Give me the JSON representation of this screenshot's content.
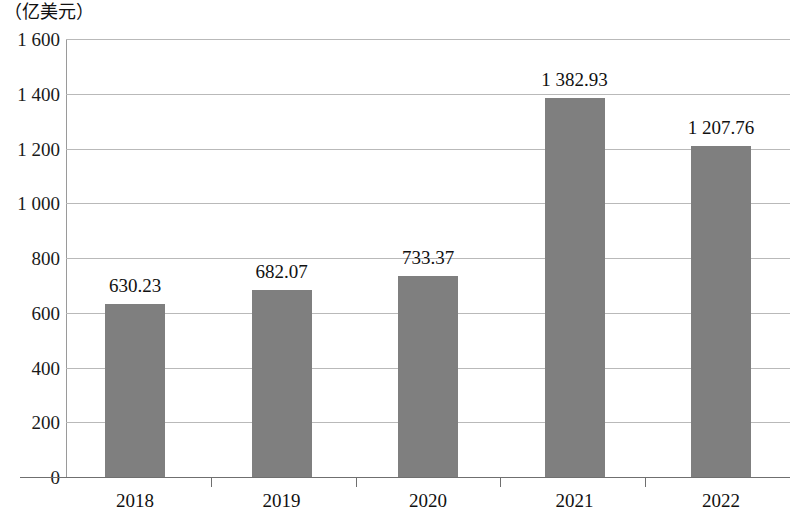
{
  "chart_data": {
    "type": "bar",
    "title": "",
    "subtitle": "",
    "xlabel": "",
    "ylabel": "（亿美元）",
    "unit_caption": "（亿美元）",
    "categories": [
      "2018",
      "2019",
      "2020",
      "2021",
      "2022"
    ],
    "values": [
      630.23,
      682.07,
      733.37,
      1382.93,
      1207.76
    ],
    "value_labels": [
      "630.23",
      "682.07",
      "733.37",
      "1 382.93",
      "1 207.76"
    ],
    "series": [
      {
        "name": "",
        "values": [
          630.23,
          682.07,
          733.37,
          1382.93,
          1207.76
        ],
        "color": "#7f7f7f"
      }
    ],
    "ylim": [
      0,
      1600
    ],
    "ytick_step": 200,
    "ytick_values": [
      1600,
      1400,
      1200,
      1000,
      800,
      600,
      400,
      200,
      0
    ],
    "ytick_labels": [
      "1 600",
      "1 400",
      "1 200",
      "1 000",
      "800",
      "600",
      "400",
      "200",
      "0"
    ],
    "grid": true,
    "grid_axis": "y",
    "legend": false,
    "legend_position": "none",
    "bar_color": "#7f7f7f",
    "gridline_color": "#b9b9b9",
    "axis_color": "#6f6f6f",
    "text_color": "#111111"
  }
}
